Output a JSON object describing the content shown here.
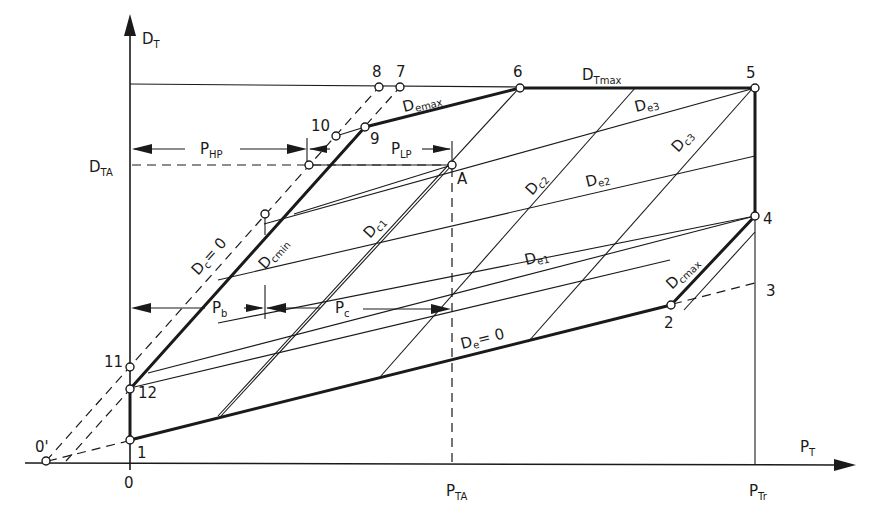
{
  "diagram": {
    "axes": {
      "y_label_main": "D",
      "y_label_sub": "T",
      "x_label_main": "P",
      "x_label_sub": "T",
      "origin": "0"
    },
    "levels": {
      "d_ta_main": "D",
      "d_ta_sub": "TA",
      "d_tmax_main": "D",
      "d_tmax_sub": "Tmax",
      "p_ta_main": "P",
      "p_ta_sub": "TA",
      "p_tr_main": "P",
      "p_tr_sub": "Tr"
    },
    "points": [
      {
        "id": "1",
        "label": "1"
      },
      {
        "id": "2",
        "label": "2"
      },
      {
        "id": "3",
        "label": "3"
      },
      {
        "id": "4",
        "label": "4"
      },
      {
        "id": "5",
        "label": "5"
      },
      {
        "id": "6",
        "label": "6"
      },
      {
        "id": "7",
        "label": "7"
      },
      {
        "id": "8",
        "label": "8"
      },
      {
        "id": "9",
        "label": "9"
      },
      {
        "id": "10",
        "label": "10"
      },
      {
        "id": "11",
        "label": "11"
      },
      {
        "id": "12",
        "label": "12"
      },
      {
        "id": "0prime",
        "label": "0'"
      },
      {
        "id": "A",
        "label": "A"
      }
    ],
    "curve_labels": {
      "demax": {
        "main": "D",
        "sub": "emax"
      },
      "de3": {
        "main": "D",
        "sub": "e3"
      },
      "de2": {
        "main": "D",
        "sub": "e2"
      },
      "de1": {
        "main": "D",
        "sub": "e1"
      },
      "de0": {
        "main": "D",
        "sub": "e",
        "suffix": "= 0"
      },
      "dc0": {
        "main": "D",
        "sub": "c",
        "suffix": "= 0"
      },
      "dcmin": {
        "main": "D",
        "sub": "cmin"
      },
      "dc1": {
        "main": "D",
        "sub": "c1"
      },
      "dc2": {
        "main": "D",
        "sub": "c2"
      },
      "dc3": {
        "main": "D",
        "sub": "c3"
      },
      "dcmax": {
        "main": "D",
        "sub": "cmax"
      }
    },
    "dimensions": {
      "p_hp": {
        "main": "P",
        "sub": "HP"
      },
      "p_lp": {
        "main": "P",
        "sub": "LP"
      },
      "p_b": {
        "main": "P",
        "sub": "b"
      },
      "p_c": {
        "main": "P",
        "sub": "c"
      }
    }
  }
}
